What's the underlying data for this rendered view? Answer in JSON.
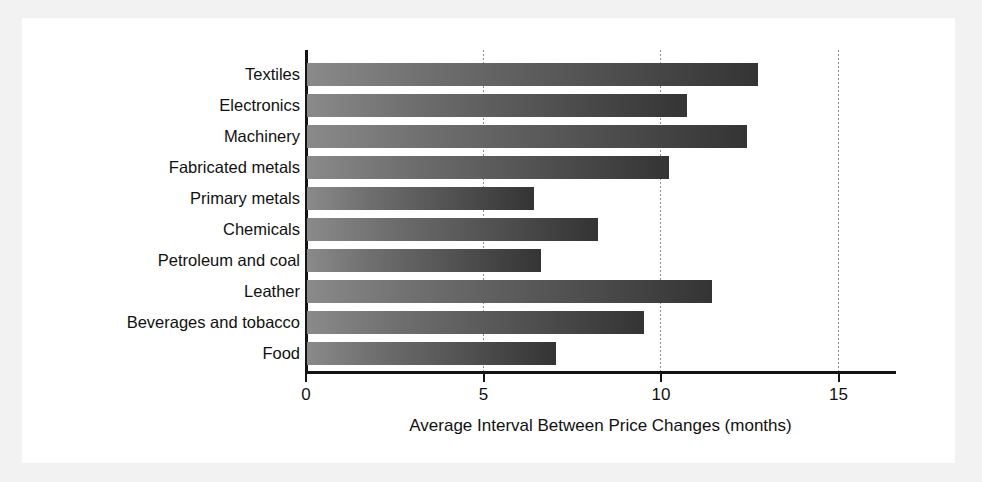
{
  "chart_data": {
    "type": "bar",
    "orientation": "horizontal",
    "title": "",
    "xlabel": "Average Interval Between Price Changes (months)",
    "ylabel": "",
    "categories": [
      "Textiles",
      "Electronics",
      "Machinery",
      "Fabricated metals",
      "Primary metals",
      "Chemicals",
      "Petroleum and coal",
      "Leather",
      "Beverages and tobacco",
      "Food"
    ],
    "values": [
      12.7,
      10.7,
      12.4,
      10.2,
      6.4,
      8.2,
      6.6,
      11.4,
      9.5,
      7.0
    ],
    "xlim": [
      0,
      16.1
    ],
    "xticks": [
      0,
      5,
      10,
      15
    ],
    "xtick_labels": [
      "0",
      "5",
      "10",
      "15"
    ],
    "grid": "vertical-dotted-at-xticks",
    "legend": "none",
    "units": "months",
    "bar_gradient_start": "#8a8a8a",
    "bar_gradient_end": "#343434",
    "axis_color": "#141414",
    "gridline_color": "#8d8d8d",
    "panel_background": "#ffffff",
    "figure_background": "#f2f2f2"
  }
}
